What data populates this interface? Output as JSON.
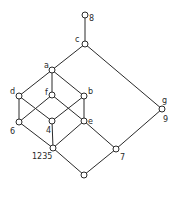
{
  "diagram": {
    "type": "hasse-lattice",
    "nodes": [
      {
        "id": "top",
        "label": "8",
        "x": 85,
        "y": 15,
        "lx": 89,
        "ly": 21
      },
      {
        "id": "c",
        "label": "c",
        "x": 85,
        "y": 44,
        "lx": 75,
        "ly": 42
      },
      {
        "id": "a",
        "label": "a",
        "x": 52,
        "y": 70,
        "lx": 44,
        "ly": 68
      },
      {
        "id": "d",
        "label": "d",
        "x": 19,
        "y": 96,
        "lx": 10,
        "ly": 94
      },
      {
        "id": "f",
        "label": "f",
        "x": 52,
        "y": 95,
        "lx": 45,
        "ly": 95
      },
      {
        "id": "b",
        "label": "b",
        "x": 84,
        "y": 96,
        "lx": 88,
        "ly": 94
      },
      {
        "id": "6",
        "label": "6",
        "x": 19,
        "y": 122,
        "lx": 10,
        "ly": 134
      },
      {
        "id": "4",
        "label": "4",
        "x": 52,
        "y": 121,
        "lx": 46,
        "ly": 133
      },
      {
        "id": "e",
        "label": "e",
        "x": 84,
        "y": 121,
        "lx": 88,
        "ly": 124
      },
      {
        "id": "1235",
        "label": "1235",
        "x": 53,
        "y": 148,
        "lx": 32,
        "ly": 159
      },
      {
        "id": "7",
        "label": "7",
        "x": 116,
        "y": 149,
        "lx": 120,
        "ly": 160
      },
      {
        "id": "g9",
        "label": "g",
        "label2": "9",
        "x": 162,
        "y": 109,
        "lx": 162,
        "ly": 103,
        "lx2": 163,
        "ly2": 122
      },
      {
        "id": "bottom",
        "label": "",
        "x": 84,
        "y": 175
      }
    ],
    "edges": [
      [
        "top",
        "c"
      ],
      [
        "c",
        "a"
      ],
      [
        "c",
        "g9"
      ],
      [
        "a",
        "d"
      ],
      [
        "a",
        "f"
      ],
      [
        "a",
        "b"
      ],
      [
        "d",
        "6"
      ],
      [
        "d",
        "4"
      ],
      [
        "f",
        "6"
      ],
      [
        "f",
        "e"
      ],
      [
        "b",
        "4"
      ],
      [
        "b",
        "e"
      ],
      [
        "6",
        "1235"
      ],
      [
        "4",
        "1235"
      ],
      [
        "e",
        "1235"
      ],
      [
        "e",
        "7"
      ],
      [
        "1235",
        "bottom"
      ],
      [
        "7",
        "bottom"
      ],
      [
        "g9",
        "7"
      ]
    ]
  }
}
